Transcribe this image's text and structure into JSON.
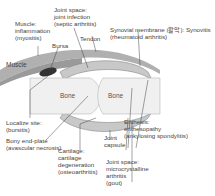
{
  "diagram": {
    "inner_labels": {
      "muscle": "Muscle",
      "bone_left": "Bone",
      "bone_right": "Bone"
    },
    "labels": {
      "muscle_inflammation": [
        "Muscle:",
        "inflammation",
        "(myositis)"
      ],
      "joint_space_infection": [
        "Joint space:",
        "joint infection",
        "(septic arthritis)"
      ],
      "bursa": "Bursa",
      "tendon": "Tendon",
      "synovial_membrane": [
        "Synovial membrane (활막): Synovitis",
        "(rheumatoid arthritis)"
      ],
      "localize_site": [
        "Localize site:",
        "(bursitis)"
      ],
      "bony_end_plate": [
        "Bony end-plate",
        "(avascular necrosis)"
      ],
      "joint_capsule": [
        "Joint",
        "capsule"
      ],
      "cartilage": [
        "Cartilage:",
        "cartilage",
        "degeneration",
        "(osteoarthritis)"
      ],
      "enthesis": [
        "Enthesis:",
        "enthesopathy",
        "(ankylosing spondylitis)"
      ],
      "joint_space_crystal": [
        "Joint space:",
        "microcrystalline",
        "arthritis",
        "(gout)"
      ]
    }
  }
}
